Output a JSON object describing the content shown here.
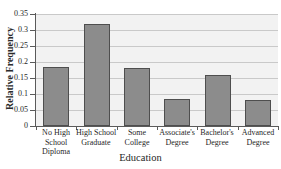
{
  "chart_data": {
    "type": "bar",
    "title": "Educational Attainment of Americans",
    "xlabel": "Education",
    "ylabel": "Relative Frequency",
    "categories": [
      "No High School Diploma",
      "High School Graduate",
      "Some College",
      "Associate's Degree",
      "Bachelor's Degree",
      "Advanced Degree"
    ],
    "category_lines": [
      [
        "No High",
        "School",
        "Diploma"
      ],
      [
        "High School",
        "Graduate"
      ],
      [
        "Some",
        "College"
      ],
      [
        "Associate's",
        "Degree"
      ],
      [
        "Bachelor's",
        "Degree"
      ],
      [
        "Advanced",
        "Degree"
      ]
    ],
    "values": [
      0.185,
      0.32,
      0.182,
      0.085,
      0.16,
      0.08
    ],
    "ylim": [
      0,
      0.35
    ],
    "ytick_values": [
      0,
      0.05,
      0.1,
      0.15,
      0.2,
      0.25,
      0.3,
      0.35
    ],
    "ytick_labels": [
      "0",
      "0.05",
      "0.1",
      "0.15",
      "0.2",
      "0.25",
      "0.3",
      "0.35"
    ],
    "grid": "horizontal",
    "legend": "none",
    "bar_color": "#8c8c8c",
    "bar_edge_color": "#4e4e4e",
    "plot_background": "#f2f2f2",
    "gridline_color": "#c9c9c9",
    "axis_color": "#5a5a5a"
  }
}
